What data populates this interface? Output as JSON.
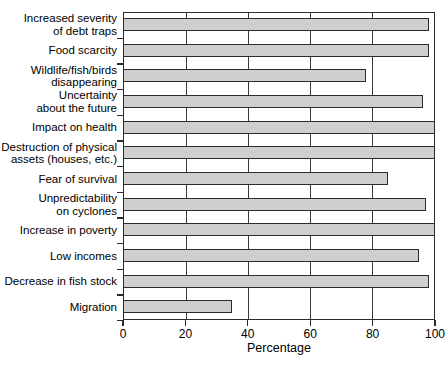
{
  "chart_data": {
    "type": "bar",
    "orientation": "horizontal",
    "title": "",
    "xlabel": "Percentage",
    "ylabel": "",
    "xlim": [
      0,
      100
    ],
    "xticks": [
      0,
      20,
      40,
      60,
      80,
      100
    ],
    "grid": true,
    "legend": null,
    "categories": [
      "Increased severity\nof debt traps",
      "Food scarcity",
      "Wildlife/fish/birds\ndisappearing",
      "Uncertainty\nabout the future",
      "Impact on health",
      "Destruction of physical\nassets (houses, etc.)",
      "Fear of survival",
      "Unpredictability\non cyclones",
      "Increase in poverty",
      "Low incomes",
      "Decrease in fish stock",
      "Migration"
    ],
    "values": [
      98,
      98,
      78,
      96,
      100,
      100,
      85,
      97,
      100,
      95,
      98,
      35
    ],
    "bar_color": "#cfcfcf",
    "bar_edge_color": "#2b2b2b",
    "axis_color": "#2b2b2b",
    "background": "#ffffff"
  }
}
